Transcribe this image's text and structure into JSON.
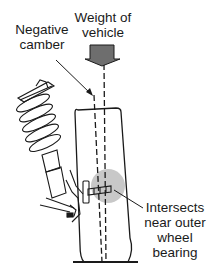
{
  "diagram": {
    "labels": {
      "weight": "Weight of\nvehicle",
      "camber": "Negative\ncamber",
      "intersects": "Intersects\nnear outer\nwheel\nbearing"
    },
    "colors": {
      "line": "#1a1a1a",
      "arrow_fill": "#6e6e6e",
      "bearing_highlight": "#c8c8c8",
      "background": "#ffffff"
    },
    "elements": [
      "weight-arrow",
      "vertical-load-line",
      "camber-line",
      "tire",
      "coil-spring",
      "strut",
      "steering-knuckle",
      "lower-control-arm",
      "wheel-bearing-highlight",
      "ground-line"
    ]
  }
}
